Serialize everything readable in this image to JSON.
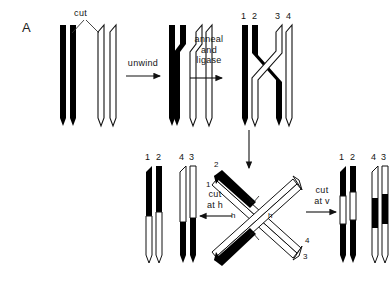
{
  "figure": {
    "panel_label": "A",
    "topic": "Holliday junction recombination model"
  },
  "steps": {
    "cut": "cut",
    "unwind": "unwind",
    "anneal_ligase": "anneal\nand\nligase",
    "anneal_line1": "anneal",
    "anneal_line2": "and",
    "anneal_line3": "ligase",
    "cut_at_h_line1": "cut",
    "cut_at_h_line2": "at  h",
    "cut_at_v_line1": "cut",
    "cut_at_v_line2": "at  v"
  },
  "strand_labels": {
    "ligated_left": "1 2",
    "ligated_left_a": "1",
    "ligated_left_b": "2",
    "ligated_right_a": "3",
    "ligated_right_b": "4",
    "product_h_left_a": "1",
    "product_h_left_b": "2",
    "product_h_right_a": "4",
    "product_h_right_b": "3",
    "product_v_left_a": "1",
    "product_v_left_b": "2",
    "product_v_right_a": "4",
    "product_v_right_b": "3"
  },
  "junction": {
    "arm_upper_left_outer": "1",
    "arm_upper_left_inner": "2",
    "arm_lower_right_outer": "3",
    "arm_lower_right_inner": "4",
    "cut_axis_top": "v",
    "cut_axis_left": "h",
    "cut_axis_right": "h",
    "cut_axis_bottom": "v"
  },
  "colors": {
    "black_strand": "#000000",
    "white_strand": "#ffffff",
    "outline": "#111111",
    "background": "#ffffff"
  }
}
